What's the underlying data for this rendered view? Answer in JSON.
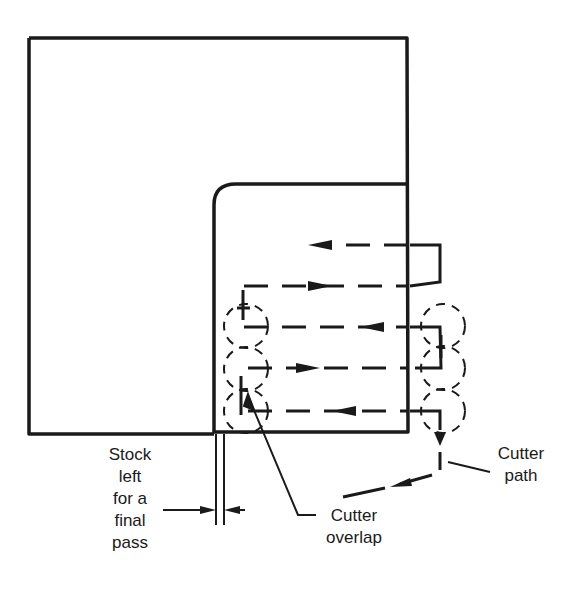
{
  "diagram": {
    "type": "milling cutter path schematic",
    "labels": {
      "stock": [
        "Stock",
        "left",
        "for a",
        "final",
        "pass"
      ],
      "cutter_overlap": [
        "Cutter",
        "overlap"
      ],
      "cutter_path": [
        "Cutter",
        "path"
      ]
    },
    "colors": {
      "ink": "#1a1a1a",
      "background": "#ffffff"
    },
    "passes": [
      {
        "y": 245,
        "direction": "left"
      },
      {
        "y": 286,
        "direction": "right"
      },
      {
        "y": 327,
        "direction": "left"
      },
      {
        "y": 368,
        "direction": "right"
      },
      {
        "y": 411,
        "direction": "left"
      }
    ]
  }
}
